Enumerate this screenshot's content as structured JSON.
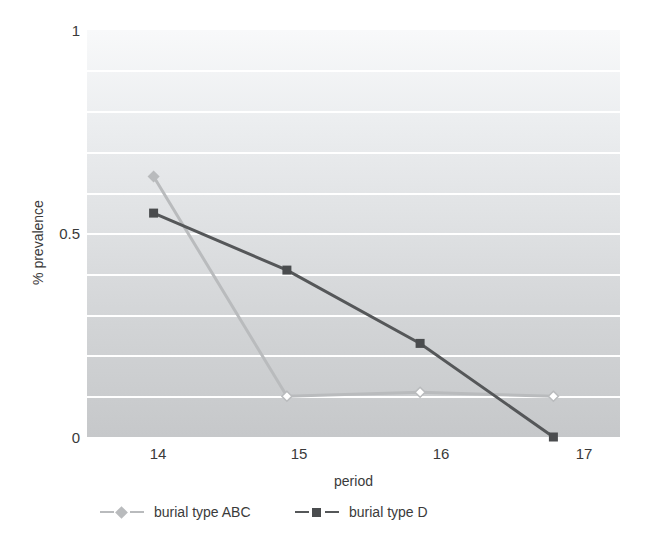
{
  "chart_data": {
    "type": "line",
    "title": "",
    "xlabel": "period",
    "ylabel": "% prevalence",
    "x": [
      14,
      15,
      16,
      17
    ],
    "categories": [
      "14",
      "15",
      "16",
      "17"
    ],
    "xlim": [
      13.5,
      17.5
    ],
    "ylim": [
      0,
      1
    ],
    "yticks": [
      0,
      0.5,
      1
    ],
    "ytick_labels": [
      "0",
      "0.5",
      "1"
    ],
    "xtick_labels": [
      "14",
      "15",
      "16",
      "17"
    ],
    "gridlines": {
      "horizontal": true,
      "vertical": false,
      "values": [
        0.1,
        0.2,
        0.3,
        0.4,
        0.5,
        0.6,
        0.7,
        0.8,
        0.9
      ],
      "color": "#ffffff"
    },
    "legend_position": "bottom",
    "series": [
      {
        "name": "burial type ABC",
        "values": [
          0.64,
          0.1,
          0.11,
          0.1
        ],
        "color": "#b9bbbd",
        "marker": "diamond",
        "marker_fill": "#ffffff",
        "line_style": "solid"
      },
      {
        "name": "burial type D",
        "values": [
          0.55,
          0.41,
          0.23,
          0.0
        ],
        "color": "#555759",
        "marker": "square",
        "marker_fill": "#4a4c4e",
        "line_style": "solid"
      }
    ],
    "plot_background": {
      "top": "#f8f9fa",
      "bottom": "#c6c8ca"
    }
  },
  "axes": {
    "y_title": "% prevalence",
    "x_title": "period",
    "y_ticks": [
      {
        "label": "1",
        "value": 1
      },
      {
        "label": "0.5",
        "value": 0.5
      },
      {
        "label": "0",
        "value": 0
      }
    ],
    "x_ticks": [
      {
        "label": "14",
        "value": 14
      },
      {
        "label": "15",
        "value": 15
      },
      {
        "label": "16",
        "value": 16
      },
      {
        "label": "17",
        "value": 17
      }
    ]
  },
  "legend": {
    "entries": [
      {
        "label": "burial type ABC",
        "color": "#b9bbbd",
        "marker": "diamond"
      },
      {
        "label": "burial type D",
        "color": "#555759",
        "marker": "square"
      }
    ]
  }
}
